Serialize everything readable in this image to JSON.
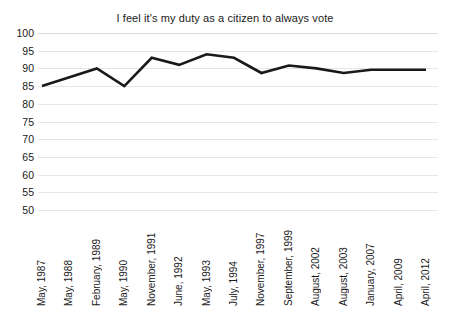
{
  "chart_data": {
    "type": "line",
    "title": "I feel it's my duty as a citizen to always vote",
    "xlabel": "",
    "ylabel": "",
    "ylim": [
      50,
      100
    ],
    "ytick_step": 5,
    "yticks": [
      100,
      95,
      90,
      85,
      80,
      75,
      70,
      65,
      60,
      55,
      50
    ],
    "grid": true,
    "legend": "none",
    "line_color": "#1a1a1a",
    "grid_color": "#e6e6e6",
    "background_color": "#ffffff",
    "categories": [
      "May, 1987",
      "May, 1988",
      "February, 1989",
      "May, 1990",
      "November, 1991",
      "June, 1992",
      "May, 1993",
      "July, 1994",
      "November, 1997",
      "September, 1999",
      "August, 2002",
      "August, 2003",
      "January, 2007",
      "April, 2009",
      "April, 2012"
    ],
    "values": [
      85,
      87.5,
      90,
      85,
      93,
      91,
      94,
      93,
      88.7,
      90.8,
      90,
      88.7,
      89.6,
      89.6,
      89.6
    ]
  }
}
